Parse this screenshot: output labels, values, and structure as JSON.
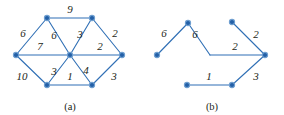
{
  "figure": {
    "colors": {
      "edge": "#2f6fb5",
      "node_fill": "#2460a7",
      "node_stroke": "#6f9fd0",
      "text": "#231f20",
      "background": "#ffffff"
    },
    "panels": [
      {
        "id": "a",
        "caption": "(a)",
        "caption_pos": {
          "x": 70,
          "y": 107
        },
        "nodes": [
          {
            "id": "tl",
            "x": 47,
            "y": 18
          },
          {
            "id": "tr",
            "x": 92,
            "y": 18
          },
          {
            "id": "l",
            "x": 16,
            "y": 55
          },
          {
            "id": "c",
            "x": 70,
            "y": 55
          },
          {
            "id": "r",
            "x": 122,
            "y": 55
          },
          {
            "id": "bl",
            "x": 47,
            "y": 85
          },
          {
            "id": "br",
            "x": 92,
            "y": 85
          }
        ],
        "edges": [
          {
            "from": "tl",
            "to": "tr",
            "weight": "9",
            "lx": 70,
            "ly": 9
          },
          {
            "from": "l",
            "to": "tl",
            "weight": "6",
            "lx": 23,
            "ly": 33
          },
          {
            "from": "tl",
            "to": "c",
            "weight": "6",
            "lx": 54,
            "ly": 35
          },
          {
            "from": "tr",
            "to": "c",
            "weight": "3",
            "lx": 80,
            "ly": 34
          },
          {
            "from": "tr",
            "to": "r",
            "weight": "2",
            "lx": 115,
            "ly": 33
          },
          {
            "from": "l",
            "to": "c",
            "weight": "7",
            "lx": 40,
            "ly": 46
          },
          {
            "from": "c",
            "to": "r",
            "weight": "2",
            "lx": 100,
            "ly": 46
          },
          {
            "from": "l",
            "to": "bl",
            "weight": "10",
            "lx": 22,
            "ly": 76
          },
          {
            "from": "bl",
            "to": "c",
            "weight": "3",
            "lx": 54,
            "ly": 71
          },
          {
            "from": "bl",
            "to": "br",
            "weight": "1",
            "lx": 70,
            "ly": 76
          },
          {
            "from": "c",
            "to": "br",
            "weight": "4",
            "lx": 86,
            "ly": 70
          },
          {
            "from": "br",
            "to": "r",
            "weight": "3",
            "lx": 114,
            "ly": 76
          }
        ]
      },
      {
        "id": "b",
        "caption": "(b)",
        "caption_pos": {
          "x": 212,
          "y": 107
        },
        "nodes": [
          {
            "id": "l",
            "x": 157,
            "y": 55
          },
          {
            "id": "t",
            "x": 188,
            "y": 23
          },
          {
            "id": "tr",
            "x": 232,
            "y": 22
          },
          {
            "id": "r",
            "x": 265,
            "y": 55
          },
          {
            "id": "bl",
            "x": 187,
            "y": 85
          },
          {
            "id": "br",
            "x": 232,
            "y": 85
          }
        ],
        "bend": {
          "x": 210,
          "y": 55
        },
        "edges": [
          {
            "from": "l",
            "to": "t",
            "weight": "6",
            "lx": 164,
            "ly": 33
          },
          {
            "from": "t",
            "to": "bend",
            "weight": "6",
            "lx": 195,
            "ly": 34
          },
          {
            "from": "bend",
            "to": "r",
            "weight": "2",
            "lx": 235,
            "ly": 46
          },
          {
            "from": "tr",
            "to": "r",
            "weight": "2",
            "lx": 256,
            "ly": 34
          },
          {
            "from": "bl",
            "to": "br",
            "weight": "1",
            "lx": 209,
            "ly": 76
          },
          {
            "from": "br",
            "to": "r",
            "weight": "3",
            "lx": 256,
            "ly": 76
          }
        ]
      }
    ]
  }
}
